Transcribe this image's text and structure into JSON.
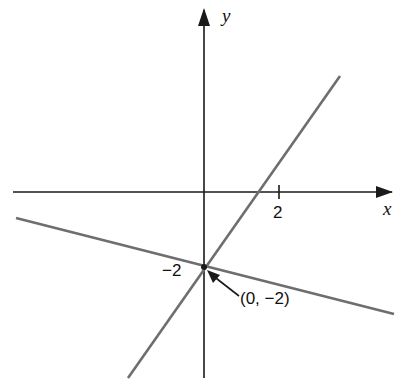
{
  "diagram": {
    "type": "coordinate-plane",
    "axes": {
      "x_label": "x",
      "y_label": "y",
      "x_tick_label": "2",
      "y_tick_label": "−2"
    },
    "point": {
      "label": "(0, −2)",
      "x": 0,
      "y": -2
    },
    "lines": [
      {
        "name": "steep-line",
        "description": "line through (0,-2) with positive slope, crossing x-axis between 0 and 2"
      },
      {
        "name": "shallow-line",
        "description": "line through (0,-2) with shallow negative slope"
      }
    ],
    "colors": {
      "axis": "#1a1a1a",
      "line": "#6e6e6e",
      "background": "#ffffff"
    }
  }
}
